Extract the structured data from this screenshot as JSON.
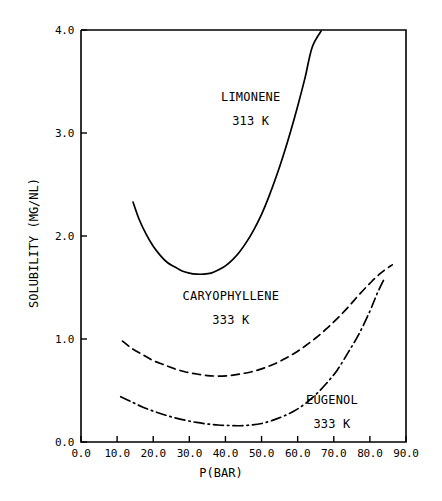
{
  "chart_data": {
    "type": "line",
    "title": "",
    "subtitle": "",
    "xlabel": "P(BAR)",
    "ylabel": "SOLUBILITY (MG/NL)",
    "xlim": [
      0.0,
      90.0
    ],
    "ylim": [
      0.0,
      4.0
    ],
    "xticks": [
      "0.0",
      "10.0",
      "20.0",
      "30.0",
      "40.0",
      "50.0",
      "60.0",
      "70.0",
      "80.0",
      "90.0"
    ],
    "xtick_values": [
      0,
      10,
      20,
      30,
      40,
      50,
      60,
      70,
      80,
      90
    ],
    "yticks": [
      "0.0",
      "1.0",
      "2.0",
      "3.0",
      "4.0"
    ],
    "ytick_values": [
      0,
      1,
      2,
      3,
      4
    ],
    "grid": false,
    "legend_position": "inline-annotations",
    "series": [
      {
        "name": "LIMONENE",
        "temperature": "313 K",
        "linestyle": "solid",
        "color": "#000000",
        "annotation_x": 47,
        "annotation_y": 3.35,
        "x": [
          14.4,
          16.0,
          18.0,
          20.0,
          22.0,
          24.0,
          26.0,
          28.0,
          30.0,
          32.0,
          34.0,
          36.0,
          38.0,
          40.0,
          42.0,
          44.0,
          46.0,
          48.0,
          50.0,
          52.0,
          54.0,
          56.0,
          58.0,
          60.0,
          62.0,
          64.0,
          66.5
        ],
        "y": [
          2.33,
          2.17,
          2.02,
          1.9,
          1.81,
          1.74,
          1.7,
          1.66,
          1.64,
          1.63,
          1.63,
          1.64,
          1.67,
          1.71,
          1.77,
          1.85,
          1.95,
          2.07,
          2.21,
          2.38,
          2.57,
          2.78,
          3.01,
          3.26,
          3.53,
          3.83,
          3.99
        ]
      },
      {
        "name": "CARYOPHYLLENE",
        "temperature": "333 K",
        "linestyle": "dashed",
        "color": "#000000",
        "annotation_x": 41.5,
        "annotation_y": 1.42,
        "x": [
          11.5,
          14.0,
          17.0,
          20.0,
          23.0,
          26.0,
          29.0,
          32.0,
          35.0,
          38.0,
          41.0,
          44.0,
          47.0,
          50.0,
          53.0,
          56.0,
          59.0,
          62.0,
          65.0,
          68.0,
          71.0,
          74.0,
          77.0,
          80.0,
          83.0,
          86.2
        ],
        "y": [
          0.98,
          0.91,
          0.85,
          0.79,
          0.75,
          0.71,
          0.68,
          0.66,
          0.645,
          0.64,
          0.645,
          0.66,
          0.68,
          0.71,
          0.75,
          0.8,
          0.86,
          0.93,
          1.01,
          1.1,
          1.2,
          1.31,
          1.43,
          1.54,
          1.64,
          1.72
        ]
      },
      {
        "name": "EUGENOL",
        "temperature": "333 K",
        "linestyle": "dashdot",
        "color": "#000000",
        "annotation_x": 69.5,
        "annotation_y": 0.41,
        "x": [
          11.0,
          14.0,
          17.0,
          20.0,
          23.0,
          26.0,
          29.0,
          32.0,
          35.0,
          38.0,
          41.0,
          44.0,
          47.0,
          50.0,
          53.0,
          56.0,
          59.0,
          62.0,
          65.0,
          68.0,
          71.0,
          74.0,
          77.0,
          80.0,
          82.0,
          84.2
        ],
        "y": [
          0.44,
          0.39,
          0.34,
          0.3,
          0.265,
          0.235,
          0.21,
          0.19,
          0.175,
          0.165,
          0.16,
          0.158,
          0.165,
          0.18,
          0.21,
          0.25,
          0.3,
          0.37,
          0.46,
          0.57,
          0.7,
          0.87,
          1.05,
          1.27,
          1.44,
          1.6
        ]
      }
    ]
  }
}
